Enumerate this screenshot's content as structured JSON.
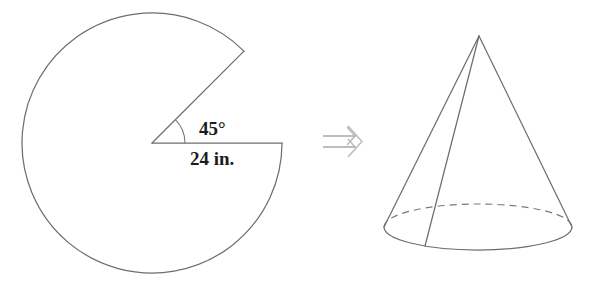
{
  "figure": {
    "background_color": "#ffffff",
    "stroke_color": "#6e6e70",
    "text_color": "#1c1c1c",
    "arrow_color": "#b9b9bb"
  },
  "sector": {
    "name": "circular sector with 45 degree notch removed",
    "angle_label": "45°",
    "radius_label": "24 in.",
    "center": {
      "x": 152,
      "y": 143
    },
    "radius": 130,
    "cut_start_angle_deg": 0,
    "cut_end_angle_deg": 45,
    "arc_sweep_deg": 315
  },
  "transform_arrow": {
    "symbol": "⟹",
    "name": "implies-arrow",
    "direction": "right"
  },
  "cone": {
    "name": "right circular cone",
    "apex": {
      "x": 479,
      "y": 36
    },
    "base_center": {
      "x": 478,
      "y": 227
    },
    "base_rx": 94,
    "base_ry": 23,
    "seam_base_point": {
      "x": 425,
      "y": 246
    },
    "hidden_edge_style": "dashed",
    "visible_edge_style": "solid"
  }
}
